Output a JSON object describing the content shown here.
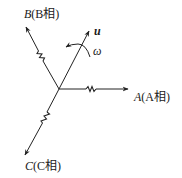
{
  "diagram": {
    "type": "three-phase stator winding axes with rotating vector",
    "center": {
      "x": 59,
      "y": 89
    },
    "line_color": "#222222",
    "axes": [
      {
        "id": "A",
        "symbol": "A",
        "paren": "(A相)",
        "tip": {
          "x": 129,
          "y": 89
        }
      },
      {
        "id": "B",
        "symbol": "B",
        "paren": "(B相)",
        "tip": {
          "x": 25,
          "y": 26
        }
      },
      {
        "id": "C",
        "symbol": "C",
        "paren": "(C相)",
        "tip": {
          "x": 24,
          "y": 156
        }
      }
    ],
    "vector": {
      "symbol": "u",
      "tip": {
        "x": 90,
        "y": 30
      }
    },
    "rotation": {
      "symbol": "ω",
      "direction": "counter-clockwise"
    }
  }
}
